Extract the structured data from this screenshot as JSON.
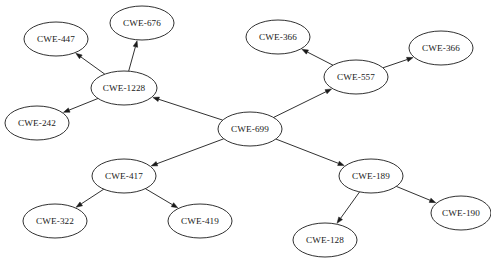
{
  "diagram": {
    "background_color": "#ffffff",
    "node_fill": "#ffffff",
    "node_stroke": "#1a1a1a",
    "edge_color": "#1a1a1a",
    "node_shape": "ellipse",
    "edge_style": "directed-arrow",
    "nodes": [
      {
        "id": "n0",
        "label": "CWE-447",
        "cx": 56,
        "cy": 39,
        "rx": 32,
        "ry": 17
      },
      {
        "id": "n1",
        "label": "CWE-676",
        "cx": 142,
        "cy": 23,
        "rx": 32,
        "ry": 17
      },
      {
        "id": "n2",
        "label": "CWE-1228",
        "cx": 124,
        "cy": 88,
        "rx": 33,
        "ry": 17
      },
      {
        "id": "n3",
        "label": "CWE-242",
        "cx": 37,
        "cy": 123,
        "rx": 32,
        "ry": 17
      },
      {
        "id": "n4",
        "label": "CWE-699",
        "cx": 250,
        "cy": 129,
        "rx": 32,
        "ry": 17
      },
      {
        "id": "n5",
        "label": "CWE-366",
        "cx": 278,
        "cy": 37,
        "rx": 32,
        "ry": 17
      },
      {
        "id": "n6",
        "label": "CWE-557",
        "cx": 356,
        "cy": 77,
        "rx": 32,
        "ry": 17
      },
      {
        "id": "n7",
        "label": "CWE-366",
        "cx": 441,
        "cy": 48,
        "rx": 32,
        "ry": 17
      },
      {
        "id": "n8",
        "label": "CWE-417",
        "cx": 124,
        "cy": 176,
        "rx": 32,
        "ry": 17
      },
      {
        "id": "n9",
        "label": "CWE-322",
        "cx": 55,
        "cy": 221,
        "rx": 32,
        "ry": 17
      },
      {
        "id": "n10",
        "label": "CWE-419",
        "cx": 200,
        "cy": 221,
        "rx": 32,
        "ry": 17
      },
      {
        "id": "n11",
        "label": "CWE-189",
        "cx": 371,
        "cy": 176,
        "rx": 32,
        "ry": 17
      },
      {
        "id": "n12",
        "label": "CWE-128",
        "cx": 325,
        "cy": 240,
        "rx": 32,
        "ry": 17
      },
      {
        "id": "n13",
        "label": "CWE-190",
        "cx": 461,
        "cy": 213,
        "rx": 30,
        "ry": 17
      }
    ],
    "edges": [
      {
        "from": "CWE-699",
        "to": "CWE-1228"
      },
      {
        "from": "CWE-699",
        "to": "CWE-557"
      },
      {
        "from": "CWE-699",
        "to": "CWE-417"
      },
      {
        "from": "CWE-699",
        "to": "CWE-189"
      },
      {
        "from": "CWE-1228",
        "to": "CWE-447"
      },
      {
        "from": "CWE-1228",
        "to": "CWE-676"
      },
      {
        "from": "CWE-1228",
        "to": "CWE-242"
      },
      {
        "from": "CWE-557",
        "to": "CWE-366"
      },
      {
        "from": "CWE-557",
        "to": "CWE-366"
      },
      {
        "from": "CWE-417",
        "to": "CWE-322"
      },
      {
        "from": "CWE-417",
        "to": "CWE-419"
      },
      {
        "from": "CWE-189",
        "to": "CWE-128"
      },
      {
        "from": "CWE-189",
        "to": "CWE-190"
      }
    ],
    "edge_pairs": [
      [
        "n4",
        "n2"
      ],
      [
        "n4",
        "n6"
      ],
      [
        "n4",
        "n8"
      ],
      [
        "n4",
        "n11"
      ],
      [
        "n2",
        "n0"
      ],
      [
        "n2",
        "n1"
      ],
      [
        "n2",
        "n3"
      ],
      [
        "n6",
        "n5"
      ],
      [
        "n6",
        "n7"
      ],
      [
        "n8",
        "n9"
      ],
      [
        "n8",
        "n10"
      ],
      [
        "n11",
        "n12"
      ],
      [
        "n11",
        "n13"
      ]
    ]
  }
}
